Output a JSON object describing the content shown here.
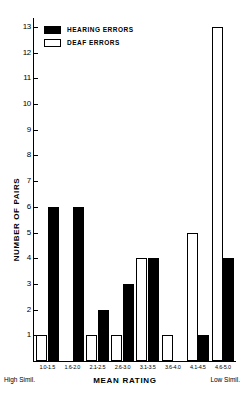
{
  "chart_data": {
    "type": "bar",
    "title": "",
    "xlabel": "MEAN RATING",
    "ylabel": "NUMBER OF PAIRS",
    "categories": [
      "1.0-1.5",
      "1.6-2.0",
      "2.1-2.5",
      "2.6-3.0",
      "3.1-3.5",
      "3.6-4.0",
      "4.1-4.5",
      "4.6-5.0"
    ],
    "series": [
      {
        "name": "DEAF ERRORS",
        "values": [
          1,
          0,
          1,
          1,
          4,
          1,
          5,
          13
        ],
        "fill": "#ffffff",
        "stroke": "#000000"
      },
      {
        "name": "HEARING ERRORS",
        "values": [
          6,
          6,
          2,
          3,
          4,
          0,
          1,
          4
        ],
        "fill": "#000000",
        "stroke": "#000000"
      }
    ],
    "ylim": [
      0,
      13
    ],
    "ytick_labels": [
      "1",
      "2",
      "3",
      "4",
      "5",
      "6",
      "7",
      "8",
      "9",
      "10",
      "11",
      "12",
      "13"
    ],
    "grid": false,
    "legend_position": "top-left",
    "axis_anchor_left": "High  Simil.",
    "axis_anchor_right": "Low  Simil."
  },
  "legend": {
    "items": [
      {
        "label": "HEARING  ERRORS",
        "style": "filled"
      },
      {
        "label": "DEAF  ERRORS",
        "style": "hollow"
      }
    ]
  }
}
